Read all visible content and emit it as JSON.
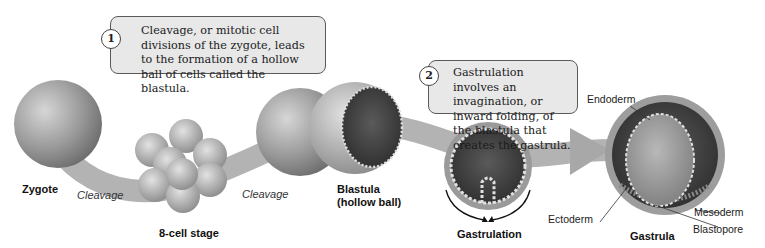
{
  "callouts": [
    {
      "number": "1",
      "text": "Cleavage, or mitotic cell divisions of the zygote, leads to the formation of a hollow ball of cells called the blastula."
    },
    {
      "number": "2",
      "text": "Gastrulation involves an invagination, or inward folding, of the blastula that creates the gastrula."
    }
  ],
  "stages": {
    "zygote": "Zygote",
    "eight_cell": "8-cell stage",
    "blastula_line1": "Blastula",
    "blastula_line2": "(hollow ball)",
    "gastrulation": "Gastrulation",
    "gastrula": "Gastrula"
  },
  "processes": {
    "cleavage_1": "Cleavage",
    "cleavage_2": "Cleavage"
  },
  "layers": {
    "endoderm": "Endoderm",
    "ectoderm": "Ectoderm",
    "mesoderm": "Mesoderm",
    "blastopore": "Blastopore"
  }
}
